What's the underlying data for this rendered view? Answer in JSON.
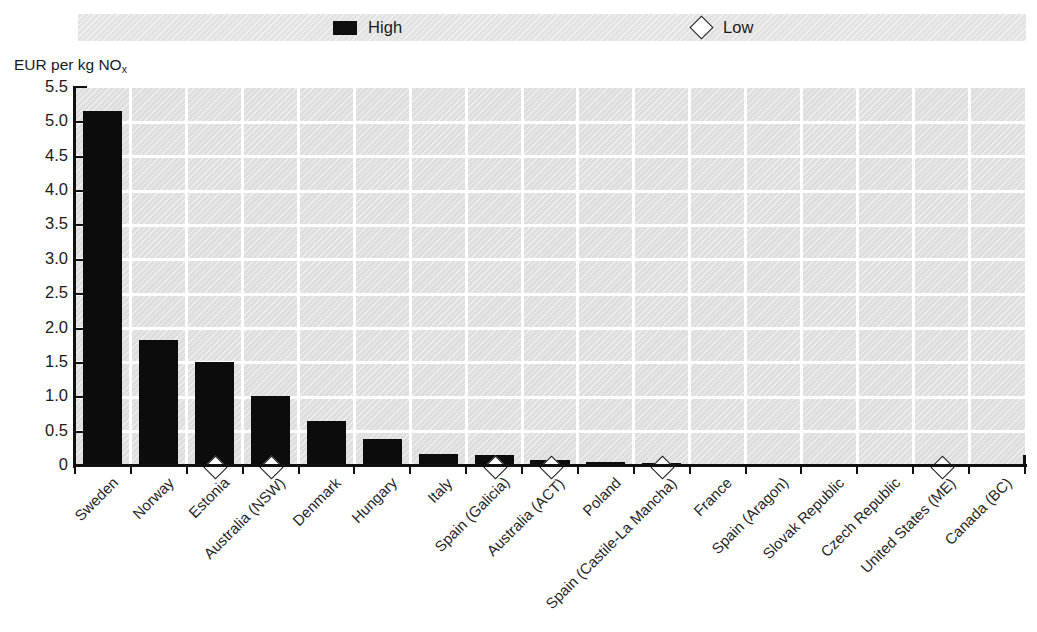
{
  "title_remnant": "",
  "legend": {
    "position": "top",
    "items": [
      {
        "label": "High",
        "marker": "filled-square",
        "color": "#0c0c0c"
      },
      {
        "label": "Low",
        "marker": "open-diamond",
        "color": "#ffffff"
      }
    ]
  },
  "y_axis": {
    "caption_prefix": "EUR per kg NO",
    "caption_sub": "x",
    "ticks": [
      "5.5",
      "5.0",
      "4.5",
      "4.0",
      "3.5",
      "3.0",
      "2.5",
      "2.0",
      "1.5",
      "1.0",
      "0.5",
      "0"
    ]
  },
  "chart_data": {
    "type": "bar",
    "title": "",
    "xlabel": "",
    "ylabel": "EUR per kg NOx",
    "ylim": [
      0,
      5.5
    ],
    "ytick_step": 0.5,
    "grid": true,
    "legend_position": "top",
    "categories": [
      "Sweden",
      "Norway",
      "Estonia",
      "Australia (NSW)",
      "Denmark",
      "Hungary",
      "Italy",
      "Spain (Galicia)",
      "Australia (ACT)",
      "Poland",
      "Spain (Castile-La Mancha)",
      "France",
      "Spain (Aragon)",
      "Slovak Republic",
      "Czech Republic",
      "United States (ME)",
      "Canada (BC)"
    ],
    "series": [
      {
        "name": "High",
        "marker": "filled-square",
        "values": [
          5.17,
          1.84,
          1.51,
          1.02,
          0.65,
          0.4,
          0.17,
          0.16,
          0.09,
          0.06,
          0.05,
          0.03,
          0.02,
          0.02,
          0.02,
          0.0,
          0.0
        ]
      },
      {
        "name": "Low",
        "marker": "open-diamond",
        "values": [
          null,
          null,
          0.0,
          0.0,
          null,
          null,
          null,
          0.0,
          0.0,
          null,
          0.0,
          null,
          null,
          null,
          null,
          0.0,
          null
        ]
      }
    ]
  },
  "colors": {
    "bar": "#0c0c0c",
    "plot_background": "#dedede",
    "gridline": "#ffffff",
    "axis": "#101010",
    "legend_strip": "#e3e3e3"
  }
}
